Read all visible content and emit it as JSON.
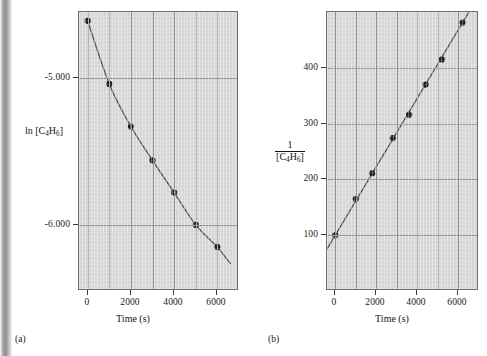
{
  "figure": {
    "background_color": "#ffffff",
    "plot_fill_color": "#d6d6d6",
    "grid_color": "#8d8d8d",
    "curve_color": "#4a4a4a",
    "marker_color": "#1c1c1c"
  },
  "panels": [
    {
      "caption": "(a)",
      "ylabel_plain": "ln [C4H6]",
      "ylabel_parts": {
        "prefix": "ln [C",
        "sub1": "4",
        "mid": "H",
        "sub2": "6",
        "suffix": "]"
      },
      "xlabel": "Time (s)",
      "x_ticks": [
        "0",
        "2000",
        "4000",
        "6000"
      ],
      "y_ticks": [
        "-5.000",
        "-6.000"
      ]
    },
    {
      "caption": "(b)",
      "ylabel_numerator": "1",
      "ylabel_denominator_parts": {
        "prefix": "[C",
        "sub1": "4",
        "mid": "H",
        "sub2": "6",
        "suffix": "]"
      },
      "xlabel": "Time (s)",
      "x_ticks": [
        "0",
        "2000",
        "4000",
        "6000"
      ],
      "y_ticks": [
        "100",
        "200",
        "300",
        "400"
      ]
    }
  ],
  "chart_data": [
    {
      "type": "scatter",
      "title": "",
      "panel": "(a)",
      "xlabel": "Time (s)",
      "ylabel": "ln [C4H6]",
      "xlim": [
        -400,
        7000
      ],
      "ylim": [
        -6.45,
        -4.55
      ],
      "x_ticks": [
        0,
        2000,
        4000,
        6000
      ],
      "y_ticks": [
        -5.0,
        -6.0
      ],
      "grid": true,
      "legend": "none",
      "x": [
        0,
        1000,
        2000,
        3000,
        4000,
        5000,
        6000
      ],
      "values": [
        -4.61,
        -5.04,
        -5.33,
        -5.56,
        -5.78,
        -6.0,
        -6.15
      ],
      "series": [
        {
          "name": "ln [C4H6] vs time",
          "x": [
            0,
            1000,
            2000,
            3000,
            4000,
            5000,
            6000
          ],
          "values": [
            -4.61,
            -5.04,
            -5.33,
            -5.56,
            -5.78,
            -6.0,
            -6.15
          ]
        }
      ],
      "fit": "curved (concave up) — plot is not linear, so reaction is not first order"
    },
    {
      "type": "scatter",
      "title": "",
      "panel": "(b)",
      "xlabel": "Time (s)",
      "ylabel": "1/[C4H6]",
      "xlim": [
        -400,
        7000
      ],
      "ylim": [
        0,
        500
      ],
      "x_ticks": [
        0,
        2000,
        4000,
        6000
      ],
      "y_ticks": [
        100,
        200,
        300,
        400
      ],
      "grid": true,
      "legend": "none",
      "x": [
        0,
        1000,
        1800,
        2800,
        3600,
        4400,
        5200,
        6200
      ],
      "values": [
        100,
        165,
        211,
        274,
        316,
        370,
        415,
        481
      ],
      "series": [
        {
          "name": "1/[C4H6] vs time",
          "x": [
            0,
            1000,
            1800,
            2800,
            3600,
            4400,
            5200,
            6200
          ],
          "values": [
            100,
            165,
            211,
            274,
            316,
            370,
            415,
            481
          ]
        }
      ],
      "fit": "straight line — reaction is second order in C4H6"
    }
  ]
}
